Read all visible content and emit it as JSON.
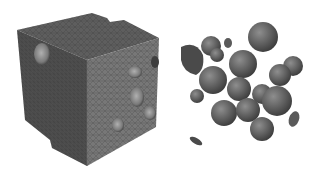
{
  "figure": {
    "panels": [
      {
        "id": "meshed-cube",
        "description": "Tetrahedral meshed cube with spherical voids/inclusions"
      },
      {
        "id": "extracted-spheres",
        "description": "Meshed spherical inclusions extracted from the cube"
      }
    ],
    "colors": {
      "background": "#ffffff",
      "cube_top": "#5e5e5e",
      "cube_left": "#4e4e4e",
      "cube_right": "#767676",
      "sphere": "#5a5a5a",
      "sphere_highlight": "#8a8a8a",
      "mesh_line": "#333333"
    }
  }
}
